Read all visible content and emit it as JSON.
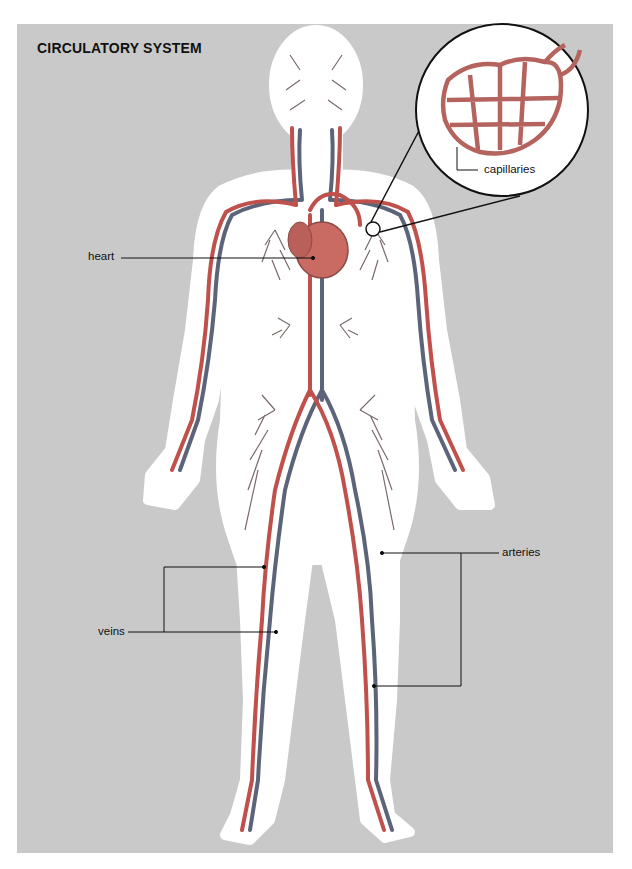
{
  "title": "CIRCULATORY SYSTEM",
  "labels": {
    "heart": "heart",
    "capillaries": "capillaries",
    "veins": "veins",
    "arteries": "arteries"
  },
  "colors": {
    "background_panel": "#c9c9c9",
    "body_silhouette": "#ffffff",
    "artery": "#c0504b",
    "vein": "#5b6478",
    "heart": "#c96a63",
    "leader_line": "#111111"
  },
  "callouts": [
    {
      "id": "heart",
      "label": "heart",
      "target": "heart"
    },
    {
      "id": "capillaries",
      "label": "capillaries",
      "target": "magnified capillary network"
    },
    {
      "id": "veins",
      "label": "veins",
      "target": "leg veins"
    },
    {
      "id": "arteries",
      "label": "arteries",
      "target": "leg arteries"
    }
  ]
}
